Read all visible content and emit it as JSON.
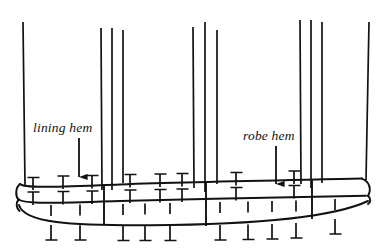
{
  "figure": {
    "type": "line-art-technical-illustration",
    "background_color": "#ffffff",
    "ink_color": "#121212",
    "labels": [
      {
        "id": "lining-hem",
        "text": "lining hem",
        "style": "italic-serif",
        "x": 33,
        "y": 120,
        "arrow": {
          "name": "lining-hem-arrow",
          "from_x": 79,
          "from_y": 140,
          "to_x": 79,
          "to_y": 178,
          "head": "solid-triangle"
        }
      },
      {
        "id": "robe-hem",
        "text": "robe hem",
        "style": "italic-serif",
        "x": 243,
        "y": 128,
        "arrow": {
          "name": "robe-hem-arrow",
          "from_x": 276,
          "from_y": 148,
          "to_x": 276,
          "to_y": 184,
          "head": "solid-triangle"
        }
      }
    ],
    "vertical_seam_lines": [
      {
        "name": "left-edge-line",
        "x": 23,
        "y_top": 22,
        "y_bottom": 185,
        "width": 1.6
      },
      {
        "name": "seam-line-1",
        "x": 101,
        "y_top": 28,
        "y_bottom": 188,
        "width": 1.6
      },
      {
        "name": "seam-line-2",
        "x": 112,
        "y_top": 28,
        "y_bottom": 188,
        "width": 1.6
      },
      {
        "name": "seam-line-3",
        "x": 123,
        "y_top": 30,
        "y_bottom": 182,
        "width": 1.6
      },
      {
        "name": "seam-line-4",
        "x": 193,
        "y_top": 26,
        "y_bottom": 186,
        "width": 1.6
      },
      {
        "name": "seam-line-5",
        "x": 205,
        "y_top": 22,
        "y_bottom": 190,
        "width": 1.6
      },
      {
        "name": "seam-line-6",
        "x": 217,
        "y_top": 30,
        "y_bottom": 184,
        "width": 1.6
      },
      {
        "name": "seam-line-7",
        "x": 300,
        "y_top": 20,
        "y_bottom": 182,
        "width": 1.6
      },
      {
        "name": "seam-line-8",
        "x": 311,
        "y_top": 20,
        "y_bottom": 186,
        "width": 1.6
      },
      {
        "name": "seam-line-9",
        "x": 322,
        "y_top": 22,
        "y_bottom": 184,
        "width": 1.6
      },
      {
        "name": "right-edge-line",
        "x": 369,
        "y_top": 22,
        "y_bottom": 180,
        "width": 1.6
      }
    ],
    "hem_bands": {
      "lining_hem_line": {
        "name": "lining-hem-curve",
        "y_left": 188,
        "y_mid": 183,
        "y_right": 181
      },
      "robe_hem_line": {
        "name": "robe-hem-curve",
        "y_left": 205,
        "y_mid": 200,
        "y_right": 197
      },
      "fold_edge_line": {
        "name": "fold-edge-curve",
        "y_left": 224,
        "y_mid": 222,
        "y_right": 211
      }
    },
    "panel_divider_lines": [
      {
        "name": "panel-divider-left",
        "x": 104,
        "y_top": 183,
        "y_bottom": 223
      },
      {
        "name": "panel-divider-mid",
        "x": 206,
        "y_top": 184,
        "y_bottom": 226
      },
      {
        "name": "panel-divider-right",
        "x": 312,
        "y_top": 180,
        "y_bottom": 218
      }
    ],
    "stitch_marks_upper": [
      {
        "name": "stitch-upper-1",
        "x": 33,
        "y": 178
      },
      {
        "name": "stitch-upper-2",
        "x": 63,
        "y": 176
      },
      {
        "name": "stitch-upper-3",
        "x": 92,
        "y": 176
      },
      {
        "name": "stitch-upper-4",
        "x": 130,
        "y": 175
      },
      {
        "name": "stitch-upper-5",
        "x": 160,
        "y": 174
      },
      {
        "name": "stitch-upper-6",
        "x": 182,
        "y": 173
      },
      {
        "name": "stitch-upper-7",
        "x": 236,
        "y": 173
      },
      {
        "name": "stitch-upper-8",
        "x": 294,
        "y": 171
      }
    ],
    "stitch_marks_middle": [
      {
        "name": "stitch-middle-1",
        "x": 33,
        "y": 192
      },
      {
        "name": "stitch-middle-2",
        "x": 63,
        "y": 192
      },
      {
        "name": "stitch-middle-3",
        "x": 92,
        "y": 191
      },
      {
        "name": "stitch-middle-4",
        "x": 130,
        "y": 190
      },
      {
        "name": "stitch-middle-5",
        "x": 160,
        "y": 189
      },
      {
        "name": "stitch-middle-6",
        "x": 182,
        "y": 189
      },
      {
        "name": "stitch-middle-7",
        "x": 236,
        "y": 187
      },
      {
        "name": "stitch-middle-8",
        "x": 294,
        "y": 185
      }
    ],
    "stitch_marks_dashes": [
      {
        "name": "stitch-dash-1",
        "x": 51,
        "y": 208
      },
      {
        "name": "stitch-dash-2",
        "x": 80,
        "y": 207
      },
      {
        "name": "stitch-dash-3",
        "x": 123,
        "y": 206
      },
      {
        "name": "stitch-dash-4",
        "x": 145,
        "y": 205
      },
      {
        "name": "stitch-dash-5",
        "x": 170,
        "y": 205
      },
      {
        "name": "stitch-dash-6",
        "x": 220,
        "y": 203
      },
      {
        "name": "stitch-dash-7",
        "x": 248,
        "y": 202
      },
      {
        "name": "stitch-dash-8",
        "x": 272,
        "y": 201
      },
      {
        "name": "stitch-dash-9",
        "x": 296,
        "y": 200
      },
      {
        "name": "stitch-dash-10",
        "x": 335,
        "y": 198
      }
    ],
    "stitch_marks_lower": [
      {
        "name": "stitch-lower-1",
        "x": 51,
        "y": 226
      },
      {
        "name": "stitch-lower-2",
        "x": 80,
        "y": 226
      },
      {
        "name": "stitch-lower-3",
        "x": 123,
        "y": 226
      },
      {
        "name": "stitch-lower-4",
        "x": 145,
        "y": 226
      },
      {
        "name": "stitch-lower-5",
        "x": 170,
        "y": 226
      },
      {
        "name": "stitch-lower-6",
        "x": 220,
        "y": 226
      },
      {
        "name": "stitch-lower-7",
        "x": 248,
        "y": 226
      },
      {
        "name": "stitch-lower-8",
        "x": 272,
        "y": 226
      },
      {
        "name": "stitch-lower-9",
        "x": 296,
        "y": 225
      },
      {
        "name": "stitch-lower-10",
        "x": 335,
        "y": 222
      }
    ]
  }
}
